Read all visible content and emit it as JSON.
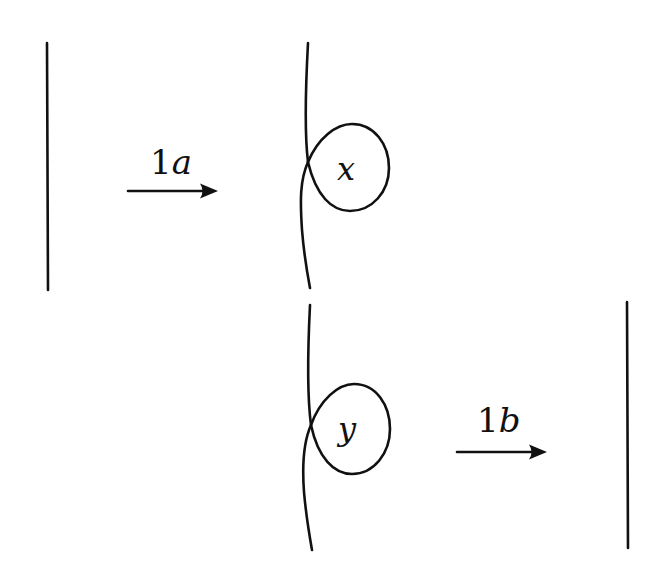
{
  "diagram": {
    "type": "Reidemeister move I",
    "stroke_color": "#111111",
    "background": "#ffffff",
    "top_row": {
      "arrow_label": {
        "digit": "1",
        "letter": "a"
      },
      "loop_label": "x"
    },
    "bottom_row": {
      "arrow_label": {
        "digit": "1",
        "letter": "b"
      },
      "loop_label": "y"
    }
  }
}
